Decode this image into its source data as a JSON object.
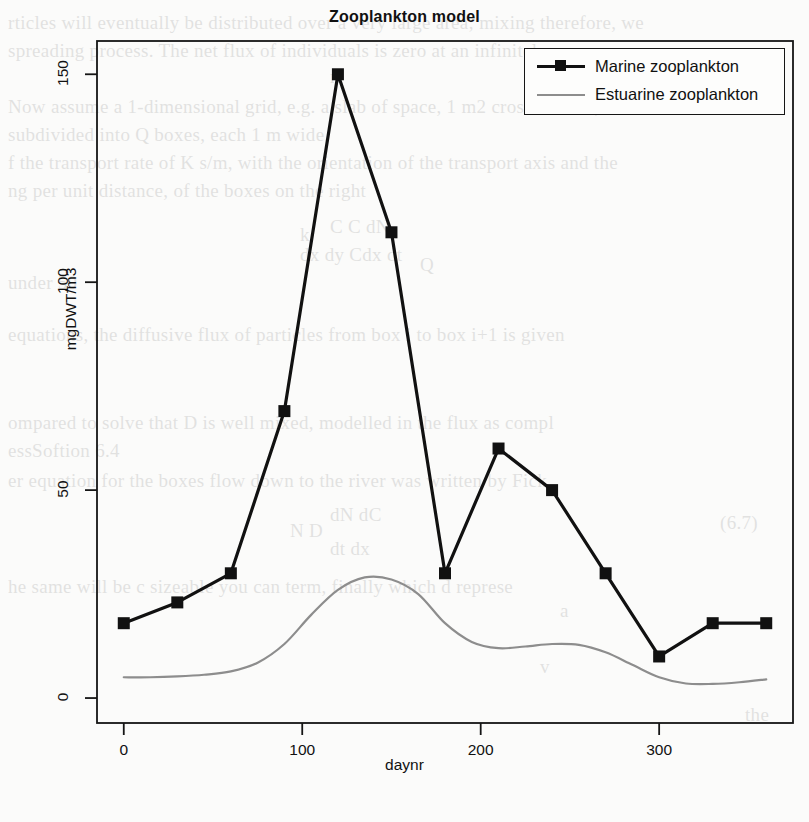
{
  "page": {
    "background_color": "#fbfbfa",
    "ghost_text": [
      {
        "t": "rticles will eventually be distributed over a very large area; mixing therefore, we",
        "x": 8,
        "y": 8
      },
      {
        "t": "spreading process. The net flux of individuals is zero at an infinitely",
        "x": 8,
        "y": 36
      },
      {
        "t": "n",
        "x": 330,
        "y": 62
      },
      {
        "t": "Now assume a 1-dimensional grid, e.g. a slab of space, 1 m2 cross-section, with",
        "x": 8,
        "y": 92
      },
      {
        "t": "subdivided into Q boxes, each 1 m wide.",
        "x": 8,
        "y": 120
      },
      {
        "t": "f the transport rate of K  s/m, with the orientation of the transport axis and the",
        "x": 8,
        "y": 148
      },
      {
        "t": "ng per unit distance, of the boxes on the right",
        "x": 8,
        "y": 176
      },
      {
        "t": "k",
        "x": 300,
        "y": 220
      },
      {
        "t": "Q",
        "x": 420,
        "y": 250
      },
      {
        "t": "C   C     dN",
        "x": 330,
        "y": 212
      },
      {
        "t": "dx  dy   Cdx    dt",
        "x": 300,
        "y": 240
      },
      {
        "t": "under      50",
        "x": 8,
        "y": 268
      },
      {
        "t": "equations, the diffusive flux of particles from box i to box i+1 is given",
        "x": 8,
        "y": 320
      },
      {
        "t": "ompared to solve that D is well mixed, modelled in the flux as compl",
        "x": 8,
        "y": 408
      },
      {
        "t": "essSoftion 6.4",
        "x": 8,
        "y": 436
      },
      {
        "t": "er equation for the boxes flow down to the river was written by Fick",
        "x": 8,
        "y": 466
      },
      {
        "t": "dN       dC",
        "x": 330,
        "y": 500
      },
      {
        "t": "N             D",
        "x": 290,
        "y": 516
      },
      {
        "t": "dt        dx",
        "x": 330,
        "y": 534
      },
      {
        "t": "(6.7)",
        "x": 720,
        "y": 508
      },
      {
        "t": "he same will be c sizeable you can term, finally which d represe",
        "x": 8,
        "y": 572
      },
      {
        "t": "a",
        "x": 560,
        "y": 596
      },
      {
        "t": "v",
        "x": 540,
        "y": 652
      },
      {
        "t": "the",
        "x": 745,
        "y": 700
      }
    ]
  },
  "chart_data": {
    "type": "line",
    "title": "Zooplankton model",
    "xlabel": "daynr",
    "ylabel": "mgDWT/m3",
    "xlim": [
      -15,
      375
    ],
    "ylim": [
      -6,
      158
    ],
    "xticks": [
      0,
      100,
      200,
      300
    ],
    "yticks": [
      0,
      50,
      100,
      150
    ],
    "grid": false,
    "legend_position": "top-right",
    "series": [
      {
        "name": "Marine zooplankton",
        "color": "#111111",
        "marker": "square",
        "line_width": 3.2,
        "x": [
          0,
          30,
          60,
          90,
          120,
          150,
          180,
          210,
          240,
          270,
          300,
          330,
          360
        ],
        "values": [
          18,
          23,
          30,
          69,
          150,
          112,
          30,
          60,
          50,
          30,
          10,
          18,
          18
        ]
      },
      {
        "name": "Estuarine zooplankton",
        "color": "#8d8d8d",
        "marker": "none",
        "line_width": 2.2,
        "x": [
          0,
          15,
          30,
          45,
          60,
          75,
          90,
          105,
          120,
          135,
          150,
          165,
          180,
          195,
          210,
          225,
          240,
          255,
          270,
          285,
          300,
          315,
          330,
          345,
          360
        ],
        "values": [
          5,
          5,
          5.2,
          5.6,
          6.4,
          8.5,
          13,
          20,
          26,
          29,
          28.5,
          25,
          18,
          13.5,
          12,
          12.4,
          13,
          12.8,
          11,
          8,
          5,
          3.5,
          3.4,
          3.8,
          4.5
        ]
      }
    ]
  },
  "legend": {
    "entries": [
      {
        "label": "Marine zooplankton",
        "color": "#111111",
        "marker": "square"
      },
      {
        "label": "Estuarine zooplankton",
        "color": "#8d8d8d",
        "marker": "none"
      }
    ]
  }
}
